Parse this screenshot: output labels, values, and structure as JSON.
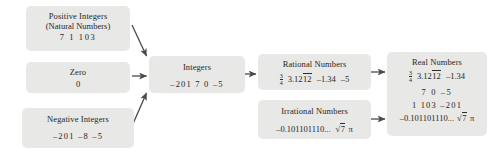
{
  "diagram": {
    "box_fill": "#e8e8e6",
    "arrow_color": "#4a4a4a",
    "background": "#ffffff",
    "nodes": {
      "positive_integers": {
        "title": "Positive Integers",
        "subtitle": "(Natural Numbers)",
        "values": "7   1   103"
      },
      "zero": {
        "title": "Zero",
        "values": "0"
      },
      "negative_integers": {
        "title": "Negative Integers",
        "values": "–201   –8   –5"
      },
      "integers": {
        "title": "Integers",
        "values": "–201   7   0   –5"
      },
      "rational_numbers": {
        "title": "Rational Numbers",
        "fraction_numerator": "3",
        "fraction_denominator": "4",
        "repeating_decimal_prefix": "3.12",
        "repeating_decimal_overline": "12",
        "value_negative_decimal": "–1.34",
        "value_negative_five": "–5"
      },
      "irrational_numbers": {
        "title": "Irrational Numbers",
        "nonrepeating_decimal": "–0.101101110...",
        "radicand": "7",
        "pi": "π"
      },
      "real_numbers": {
        "title": "Real Numbers",
        "fraction_numerator": "3",
        "fraction_denominator": "4",
        "repeating_decimal_prefix": "3.12",
        "repeating_decimal_overline": "12",
        "value_negative_decimal": "–1.34",
        "row_integers_positive": "7   0   –5",
        "row_integers_mixed": "1   103   –201",
        "nonrepeating_decimal": "–0.101101110...",
        "radicand": "7",
        "pi": "π"
      }
    },
    "arrows": [
      {
        "name": "positive-integers-to-integers",
        "from": "positive_integers",
        "to": "integers"
      },
      {
        "name": "zero-to-integers",
        "from": "zero",
        "to": "integers"
      },
      {
        "name": "negative-integers-to-integers",
        "from": "negative_integers",
        "to": "integers"
      },
      {
        "name": "integers-to-rational-numbers",
        "from": "integers",
        "to": "rational_numbers"
      },
      {
        "name": "rational-numbers-to-real-numbers",
        "from": "rational_numbers",
        "to": "real_numbers"
      },
      {
        "name": "irrational-numbers-to-real-numbers",
        "from": "irrational_numbers",
        "to": "real_numbers"
      }
    ]
  }
}
